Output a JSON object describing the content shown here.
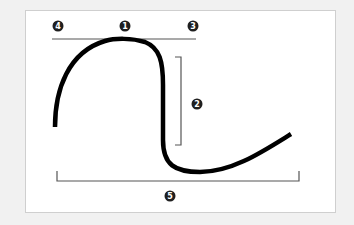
{
  "diagram": {
    "type": "annotated-curve",
    "background_color": "#f1f1f1",
    "panel_color": "#ffffff",
    "curve_color": "#000000",
    "guide_color": "#555555",
    "markers": [
      {
        "id": "m1",
        "label": "1",
        "position": "top-center",
        "describes": "curve peak touching top line"
      },
      {
        "id": "m2",
        "label": "2",
        "position": "right-middle",
        "describes": "vertical bracket spanning descent"
      },
      {
        "id": "m3",
        "label": "3",
        "position": "top-right",
        "describes": "right end of top line"
      },
      {
        "id": "m4",
        "label": "4",
        "position": "top-left",
        "describes": "left end of top line"
      },
      {
        "id": "m5",
        "label": "5",
        "position": "bottom-center",
        "describes": "horizontal bracket spanning curve width"
      }
    ]
  }
}
